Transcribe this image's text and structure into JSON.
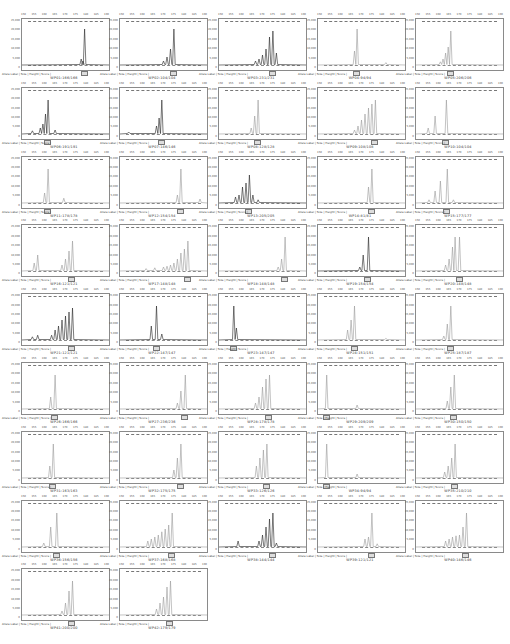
{
  "caption_label": "Allele Label  |  Size  |  Height  |  Score  |",
  "colors": {
    "trace_dark": "#222222",
    "trace_light": "#9a9a9a",
    "frame": "#8a8a8a",
    "bin": "#777777"
  },
  "chart_data": {
    "type": "line",
    "layout": {
      "columns": 5,
      "rows": 9,
      "panel_count": 42
    },
    "xlabel": "Size (bp)",
    "ylabel": "RFU",
    "grid": false,
    "panels": [
      {
        "name": "WP01:166/166",
        "dark": true,
        "peaks": [
          [
            0.72,
            0.9
          ],
          [
            0.68,
            0.15
          ],
          [
            0.7,
            0.1
          ]
        ]
      },
      {
        "name": "WP02:104/104",
        "dark": true,
        "peaks": [
          [
            0.62,
            0.9
          ],
          [
            0.58,
            0.4
          ],
          [
            0.54,
            0.2
          ],
          [
            0.5,
            0.1
          ]
        ]
      },
      {
        "name": "WP03:231/231",
        "dark": true,
        "peaks": [
          [
            0.62,
            0.85
          ],
          [
            0.58,
            0.7
          ],
          [
            0.54,
            0.4
          ],
          [
            0.5,
            0.25
          ],
          [
            0.46,
            0.15
          ],
          [
            0.42,
            0.1
          ],
          [
            0.66,
            0.3
          ]
        ]
      },
      {
        "name": "WP04:94/94",
        "dark": false,
        "peaks": [
          [
            0.45,
            0.9
          ],
          [
            0.42,
            0.35
          ],
          [
            0.78,
            0.06
          ]
        ]
      },
      {
        "name": "WP05:206/206",
        "dark": false,
        "peaks": [
          [
            0.4,
            0.85
          ],
          [
            0.37,
            0.45
          ],
          [
            0.34,
            0.3
          ],
          [
            0.31,
            0.15
          ],
          [
            0.28,
            0.08
          ]
        ]
      },
      {
        "name": "WP06:191/191",
        "dark": true,
        "peaks": [
          [
            0.3,
            0.85
          ],
          [
            0.27,
            0.5
          ],
          [
            0.24,
            0.25
          ],
          [
            0.21,
            0.15
          ],
          [
            0.38,
            0.1
          ],
          [
            0.12,
            0.08
          ]
        ]
      },
      {
        "name": "WP07:146/146",
        "dark": true,
        "peaks": [
          [
            0.48,
            0.85
          ],
          [
            0.45,
            0.4
          ],
          [
            0.42,
            0.2
          ],
          [
            0.1,
            0.05
          ]
        ]
      },
      {
        "name": "WP08:128/128",
        "dark": false,
        "peaks": [
          [
            0.45,
            0.85
          ],
          [
            0.41,
            0.45
          ],
          [
            0.37,
            0.15
          ]
        ]
      },
      {
        "name": "WP09:108/108",
        "dark": false,
        "peaks": [
          [
            0.66,
            0.85
          ],
          [
            0.62,
            0.75
          ],
          [
            0.58,
            0.65
          ],
          [
            0.54,
            0.5
          ],
          [
            0.5,
            0.35
          ],
          [
            0.46,
            0.2
          ],
          [
            0.42,
            0.1
          ]
        ]
      },
      {
        "name": "WP10:104/104",
        "dark": false,
        "peaks": [
          [
            0.35,
            0.85
          ],
          [
            0.22,
            0.45
          ],
          [
            0.14,
            0.15
          ]
        ]
      },
      {
        "name": "WP11:178/178",
        "dark": false,
        "peaks": [
          [
            0.3,
            0.85
          ],
          [
            0.26,
            0.25
          ],
          [
            0.48,
            0.12
          ]
        ]
      },
      {
        "name": "WP12:154/154",
        "dark": false,
        "peaks": [
          [
            0.7,
            0.85
          ],
          [
            0.66,
            0.2
          ],
          [
            0.92,
            0.1
          ]
        ]
      },
      {
        "name": "WP13:205/205",
        "dark": true,
        "peaks": [
          [
            0.35,
            0.7
          ],
          [
            0.31,
            0.5
          ],
          [
            0.27,
            0.4
          ],
          [
            0.23,
            0.2
          ],
          [
            0.19,
            0.15
          ],
          [
            0.39,
            0.2
          ],
          [
            0.45,
            0.08
          ]
        ]
      },
      {
        "name": "WP14:81/81",
        "dark": false,
        "peaks": [
          [
            0.62,
            0.85
          ],
          [
            0.58,
            0.4
          ]
        ]
      },
      {
        "name": "WP15:177/177",
        "dark": false,
        "peaks": [
          [
            0.36,
            0.85
          ],
          [
            0.28,
            0.55
          ],
          [
            0.22,
            0.3
          ],
          [
            0.15,
            0.08
          ],
          [
            0.43,
            0.08
          ]
        ]
      },
      {
        "name": "WP16:121/121",
        "dark": false,
        "peaks": [
          [
            0.58,
            0.75
          ],
          [
            0.54,
            0.5
          ],
          [
            0.5,
            0.3
          ],
          [
            0.46,
            0.15
          ],
          [
            0.18,
            0.4
          ],
          [
            0.14,
            0.2
          ]
        ]
      },
      {
        "name": "WP17:148/148",
        "dark": false,
        "peaks": [
          [
            0.78,
            0.75
          ],
          [
            0.74,
            0.55
          ],
          [
            0.7,
            0.45
          ],
          [
            0.66,
            0.3
          ],
          [
            0.62,
            0.2
          ],
          [
            0.58,
            0.15
          ],
          [
            0.54,
            0.12
          ],
          [
            0.5,
            0.1
          ],
          [
            0.4,
            0.08
          ],
          [
            0.3,
            0.06
          ]
        ]
      },
      {
        "name": "WP18:148/148",
        "dark": false,
        "peaks": [
          [
            0.76,
            0.85
          ],
          [
            0.72,
            0.3
          ],
          [
            0.68,
            0.1
          ]
        ]
      },
      {
        "name": "WP19:154/154",
        "dark": true,
        "peaks": [
          [
            0.58,
            0.85
          ],
          [
            0.52,
            0.4
          ],
          [
            0.48,
            0.1
          ]
        ]
      },
      {
        "name": "WP20:148/148",
        "dark": false,
        "peaks": [
          [
            0.5,
            0.85
          ],
          [
            0.45,
            0.85
          ],
          [
            0.42,
            0.6
          ],
          [
            0.38,
            0.3
          ],
          [
            0.34,
            0.15
          ]
        ]
      },
      {
        "name": "WP21:121/121",
        "dark": true,
        "peaks": [
          [
            0.58,
            0.8
          ],
          [
            0.54,
            0.7
          ],
          [
            0.5,
            0.6
          ],
          [
            0.46,
            0.5
          ],
          [
            0.42,
            0.35
          ],
          [
            0.38,
            0.25
          ],
          [
            0.34,
            0.12
          ],
          [
            0.18,
            0.12
          ],
          [
            0.12,
            0.08
          ]
        ]
      },
      {
        "name": "WP22:147/147",
        "dark": true,
        "peaks": [
          [
            0.42,
            0.85
          ],
          [
            0.36,
            0.35
          ],
          [
            0.48,
            0.15
          ]
        ]
      },
      {
        "name": "WP23:147/147",
        "dark": true,
        "peaks": [
          [
            0.17,
            0.85
          ],
          [
            0.2,
            0.3
          ]
        ]
      },
      {
        "name": "WP24:151/151",
        "dark": false,
        "peaks": [
          [
            0.42,
            0.85
          ],
          [
            0.38,
            0.5
          ],
          [
            0.34,
            0.25
          ],
          [
            0.78,
            0.04
          ]
        ]
      },
      {
        "name": "WP25:187/187",
        "dark": false,
        "peaks": [
          [
            0.4,
            0.85
          ],
          [
            0.36,
            0.4
          ],
          [
            0.32,
            0.1
          ]
        ]
      },
      {
        "name": "WP26:166/166",
        "dark": false,
        "peaks": [
          [
            0.38,
            0.85
          ],
          [
            0.33,
            0.3
          ]
        ]
      },
      {
        "name": "WP27:236/236",
        "dark": false,
        "peaks": [
          [
            0.75,
            0.85
          ],
          [
            0.7,
            0.45
          ],
          [
            0.66,
            0.15
          ]
        ]
      },
      {
        "name": "WP28:178/178",
        "dark": false,
        "peaks": [
          [
            0.58,
            0.85
          ],
          [
            0.54,
            0.75
          ],
          [
            0.5,
            0.55
          ],
          [
            0.46,
            0.3
          ],
          [
            0.42,
            0.15
          ]
        ]
      },
      {
        "name": "WP29:209/209",
        "dark": false,
        "peaks": [
          [
            0.1,
            0.85
          ],
          [
            0.45,
            0.1
          ]
        ]
      },
      {
        "name": "WP30:150/150",
        "dark": false,
        "peaks": [
          [
            0.44,
            0.85
          ],
          [
            0.4,
            0.55
          ],
          [
            0.36,
            0.2
          ]
        ]
      },
      {
        "name": "WP31:163/163",
        "dark": false,
        "peaks": [
          [
            0.36,
            0.85
          ],
          [
            0.32,
            0.3
          ]
        ]
      },
      {
        "name": "WP32:175/175",
        "dark": false,
        "peaks": [
          [
            0.7,
            0.85
          ],
          [
            0.66,
            0.5
          ],
          [
            0.62,
            0.2
          ]
        ]
      },
      {
        "name": "WP33:126/126",
        "dark": false,
        "peaks": [
          [
            0.55,
            0.85
          ],
          [
            0.51,
            0.7
          ],
          [
            0.47,
            0.5
          ],
          [
            0.43,
            0.3
          ]
        ]
      },
      {
        "name": "WP34:94/94",
        "dark": false,
        "peaks": [
          [
            0.1,
            0.85
          ],
          [
            0.45,
            0.1
          ]
        ]
      },
      {
        "name": "WP35:210/210",
        "dark": false,
        "peaks": [
          [
            0.45,
            0.85
          ],
          [
            0.41,
            0.5
          ],
          [
            0.37,
            0.3
          ],
          [
            0.33,
            0.15
          ]
        ]
      },
      {
        "name": "WP36:156/156",
        "dark": false,
        "peaks": [
          [
            0.4,
            0.85
          ],
          [
            0.33,
            0.5
          ],
          [
            0.25,
            0.1
          ]
        ]
      },
      {
        "name": "WP37:168/168",
        "dark": false,
        "peaks": [
          [
            0.6,
            0.85
          ],
          [
            0.56,
            0.55
          ],
          [
            0.52,
            0.45
          ],
          [
            0.48,
            0.38
          ],
          [
            0.44,
            0.3
          ],
          [
            0.4,
            0.25
          ],
          [
            0.36,
            0.2
          ],
          [
            0.32,
            0.15
          ]
        ]
      },
      {
        "name": "WP38:144/144",
        "dark": true,
        "peaks": [
          [
            0.62,
            0.85
          ],
          [
            0.58,
            0.7
          ],
          [
            0.54,
            0.5
          ],
          [
            0.5,
            0.3
          ],
          [
            0.46,
            0.15
          ],
          [
            0.66,
            0.1
          ],
          [
            0.22,
            0.15
          ]
        ]
      },
      {
        "name": "WP39:121/121",
        "dark": false,
        "peaks": [
          [
            0.62,
            0.85
          ],
          [
            0.58,
            0.25
          ],
          [
            0.54,
            0.2
          ],
          [
            0.68,
            0.08
          ]
        ]
      },
      {
        "name": "WP40:146/146",
        "dark": false,
        "peaks": [
          [
            0.58,
            0.85
          ],
          [
            0.54,
            0.5
          ],
          [
            0.5,
            0.3
          ],
          [
            0.46,
            0.28
          ],
          [
            0.42,
            0.25
          ],
          [
            0.38,
            0.2
          ],
          [
            0.34,
            0.15
          ]
        ]
      },
      {
        "name": "WP41:200/200",
        "dark": false,
        "peaks": [
          [
            0.58,
            0.85
          ],
          [
            0.54,
            0.6
          ],
          [
            0.5,
            0.3
          ],
          [
            0.46,
            0.1
          ]
        ]
      },
      {
        "name": "WP42:179/179",
        "dark": false,
        "peaks": [
          [
            0.58,
            0.85
          ],
          [
            0.54,
            0.7
          ],
          [
            0.5,
            0.45
          ],
          [
            0.46,
            0.3
          ],
          [
            0.42,
            0.15
          ]
        ]
      }
    ]
  },
  "yticks": [
    "25,000",
    "20,000",
    "15,000",
    "10,000",
    "5,000",
    "0"
  ],
  "xticks": [
    "150",
    "155",
    "160",
    "165",
    "170",
    "175",
    "180",
    "185",
    "190"
  ]
}
